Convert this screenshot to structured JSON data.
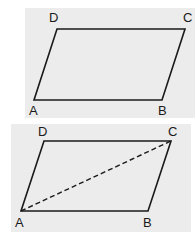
{
  "figures": [
    {
      "name": "parallelogram",
      "labels": {
        "A": "A",
        "B": "B",
        "C": "C",
        "D": "D"
      },
      "diagonal": null
    },
    {
      "name": "parallelogram-with-diagonal",
      "labels": {
        "A": "A",
        "B": "B",
        "C": "C",
        "D": "D"
      },
      "diagonal": "AC (dashed)"
    }
  ],
  "colors": {
    "panel": "#ececec",
    "stroke": "#1a1a1a"
  }
}
